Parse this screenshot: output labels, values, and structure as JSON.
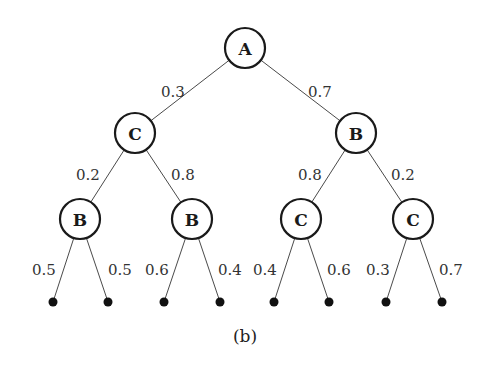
{
  "diagram": {
    "type": "probability-tree",
    "caption": "(b)",
    "node_radius": 20,
    "leaf_radius": 4.5,
    "colors": {
      "background": "#ffffff",
      "node_stroke": "#1a1a1a",
      "edge": "#4a4a4a",
      "text": "#333333",
      "leaf": "#111111"
    },
    "nodes": [
      {
        "id": "n0",
        "label": "A",
        "x": 245,
        "y": 48
      },
      {
        "id": "n1",
        "label": "C",
        "x": 135,
        "y": 133
      },
      {
        "id": "n2",
        "label": "B",
        "x": 356,
        "y": 133
      },
      {
        "id": "n3",
        "label": "B",
        "x": 80,
        "y": 219
      },
      {
        "id": "n4",
        "label": "B",
        "x": 192,
        "y": 219
      },
      {
        "id": "n5",
        "label": "C",
        "x": 301,
        "y": 219
      },
      {
        "id": "n6",
        "label": "C",
        "x": 413,
        "y": 219
      }
    ],
    "leaves": [
      {
        "id": "l0",
        "x": 53,
        "y": 302
      },
      {
        "id": "l1",
        "x": 108,
        "y": 302
      },
      {
        "id": "l2",
        "x": 164,
        "y": 302
      },
      {
        "id": "l3",
        "x": 220,
        "y": 302
      },
      {
        "id": "l4",
        "x": 274,
        "y": 302
      },
      {
        "id": "l5",
        "x": 329,
        "y": 302
      },
      {
        "id": "l6",
        "x": 386,
        "y": 302
      },
      {
        "id": "l7",
        "x": 442,
        "y": 302
      }
    ],
    "edges": [
      {
        "from": "n0",
        "to": "n1",
        "label": "0.3",
        "lx": 173,
        "ly": 92
      },
      {
        "from": "n0",
        "to": "n2",
        "label": "0.7",
        "lx": 320,
        "ly": 92
      },
      {
        "from": "n1",
        "to": "n3",
        "label": "0.2",
        "lx": 88,
        "ly": 175
      },
      {
        "from": "n1",
        "to": "n4",
        "label": "0.8",
        "lx": 183,
        "ly": 175
      },
      {
        "from": "n2",
        "to": "n5",
        "label": "0.8",
        "lx": 310,
        "ly": 175
      },
      {
        "from": "n2",
        "to": "n6",
        "label": "0.2",
        "lx": 403,
        "ly": 175
      },
      {
        "from": "n3",
        "to": "l0",
        "label": "0.5",
        "lx": 44,
        "ly": 270
      },
      {
        "from": "n3",
        "to": "l1",
        "label": "0.5",
        "lx": 120,
        "ly": 270
      },
      {
        "from": "n4",
        "to": "l2",
        "label": "0.6",
        "lx": 157,
        "ly": 270
      },
      {
        "from": "n4",
        "to": "l3",
        "label": "0.4",
        "lx": 230,
        "ly": 270
      },
      {
        "from": "n5",
        "to": "l4",
        "label": "0.4",
        "lx": 265,
        "ly": 270
      },
      {
        "from": "n5",
        "to": "l5",
        "label": "0.6",
        "lx": 339,
        "ly": 270
      },
      {
        "from": "n6",
        "to": "l6",
        "label": "0.3",
        "lx": 378,
        "ly": 270
      },
      {
        "from": "n6",
        "to": "l7",
        "label": "0.7",
        "lx": 451,
        "ly": 270
      }
    ],
    "caption_pos": {
      "x": 245,
      "y": 336
    }
  }
}
